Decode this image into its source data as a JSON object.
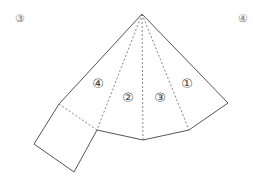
{
  "corner_labels": {
    "left": "③",
    "right": "④"
  },
  "net": {
    "description": "Net of a square-based pyramid-like solid with a square face attached",
    "stroke_color": "#555555",
    "apex": [
      142,
      14
    ],
    "outer_vertices": {
      "left_top": [
        59,
        104
      ],
      "bottom_left": [
        97,
        130
      ],
      "bottom_mid": [
        143,
        140
      ],
      "bottom_right": [
        189,
        130
      ],
      "right": [
        228,
        103
      ]
    },
    "square_face": [
      [
        59,
        104
      ],
      [
        97,
        130
      ],
      [
        74,
        172
      ],
      [
        34,
        144
      ]
    ],
    "face_labels": [
      {
        "text": "④",
        "x": 98,
        "y": 83
      },
      {
        "text": "②",
        "x": 128,
        "y": 97
      },
      {
        "text": "③",
        "x": 160,
        "y": 97
      },
      {
        "text": "①",
        "x": 187,
        "y": 83
      }
    ]
  }
}
